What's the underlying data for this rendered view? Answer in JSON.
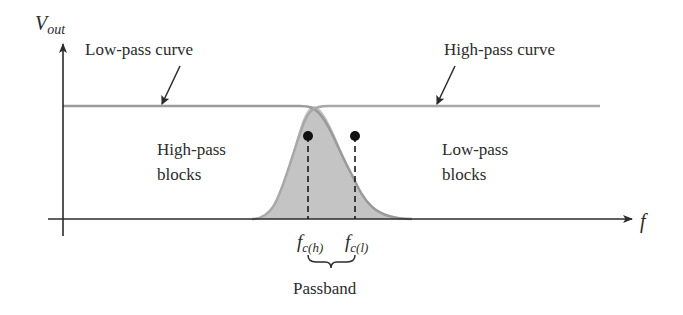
{
  "diagram": {
    "y_axis_label": {
      "main": "V",
      "sub": "out"
    },
    "x_axis_label": "f",
    "callouts": {
      "low_pass_curve": "Low-pass curve",
      "high_pass_curve": "High-pass curve"
    },
    "regions": {
      "left": {
        "line1": "High-pass",
        "line2": "blocks"
      },
      "right": {
        "line1": "Low-pass",
        "line2": "blocks"
      }
    },
    "cutoffs": {
      "high": {
        "main": "f",
        "sub": "c(h)"
      },
      "low": {
        "main": "f",
        "sub": "c(l)"
      }
    },
    "passband_label": "Passband",
    "colors": {
      "axis": "#2b2b2b",
      "curve": "#9a9a9a",
      "fill": "#c4c4c4",
      "text": "#2b2b2b",
      "marker": "#111111"
    }
  }
}
